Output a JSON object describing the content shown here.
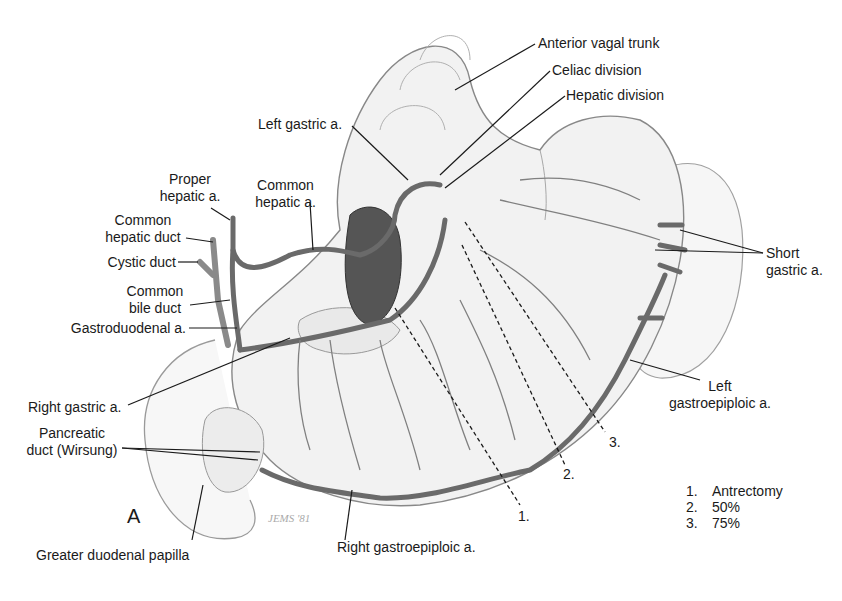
{
  "figure": {
    "panel_letter": "A",
    "signature": "JEMS '81"
  },
  "labels": {
    "anterior_vagal_trunk": "Anterior vagal trunk",
    "celiac_division": "Celiac division",
    "hepatic_division": "Hepatic division",
    "left_gastric_a": "Left gastric a.",
    "proper_hepatic_a_1": "Proper",
    "proper_hepatic_a_2": "hepatic a.",
    "common_hepatic_a_1": "Common",
    "common_hepatic_a_2": "hepatic a.",
    "common_hepatic_duct_1": "Common",
    "common_hepatic_duct_2": "hepatic duct",
    "cystic_duct": "Cystic duct",
    "common_bile_duct_1": "Common",
    "common_bile_duct_2": "bile duct",
    "gastroduodenal_a": "Gastroduodenal a.",
    "right_gastric_a": "Right gastric a.",
    "pancreatic_duct_1": "Pancreatic",
    "pancreatic_duct_2": "duct (Wirsung)",
    "greater_duodenal_papilla": "Greater duodenal papilla",
    "right_gastroepiploic_a": "Right gastroepiploic a.",
    "short_gastric_a_1": "Short",
    "short_gastric_a_2": "gastric a.",
    "left_gastroepiploic_a_1": "Left",
    "left_gastroepiploic_a_2": "gastroepiploic a."
  },
  "resection_lines": [
    {
      "marker": "1."
    },
    {
      "marker": "2."
    },
    {
      "marker": "3."
    }
  ],
  "legend": [
    {
      "num": "1.",
      "text": "Antrectomy"
    },
    {
      "num": "2.",
      "text": "50%"
    },
    {
      "num": "3.",
      "text": "75%"
    }
  ]
}
